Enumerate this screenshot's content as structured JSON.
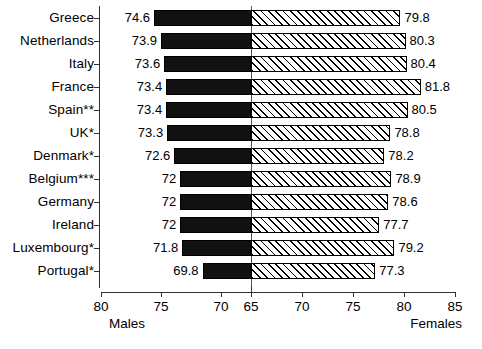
{
  "chart_data": {
    "type": "bar",
    "subtype": "bidirectional-population-pyramid",
    "title": "",
    "subtitle": "",
    "xlabel": "",
    "ylabel": "",
    "grid": false,
    "legend_position": "axis-ends",
    "categories": [
      "Greece",
      "Netherlands",
      "Italy",
      "France",
      "Spain**",
      "UK*",
      "Denmark*",
      "Belgium***",
      "Germany",
      "Ireland",
      "Luxembourg*",
      "Portugal*"
    ],
    "series": [
      {
        "name": "Males",
        "side": "left",
        "fill": "solid-black",
        "values": [
          74.6,
          73.9,
          73.6,
          73.4,
          73.4,
          73.3,
          72.6,
          72,
          72,
          72,
          71.8,
          69.8
        ],
        "value_labels": [
          "74.6",
          "73.9",
          "73.6",
          "73.4",
          "73.4",
          "73.3",
          "72.6",
          "72",
          "72",
          "72",
          "71.8",
          "69.8"
        ]
      },
      {
        "name": "Females",
        "side": "right",
        "fill": "diagonal-hatch",
        "values": [
          79.8,
          80.3,
          80.4,
          81.8,
          80.5,
          78.8,
          78.2,
          78.9,
          78.6,
          77.7,
          79.2,
          77.3
        ],
        "value_labels": [
          "79.8",
          "80.3",
          "80.4",
          "81.8",
          "80.5",
          "78.8",
          "78.2",
          "78.9",
          "78.6",
          "77.7",
          "79.2",
          "77.3"
        ]
      }
    ],
    "axis": {
      "center_value": 65,
      "left_end_value": 80,
      "right_end_value": 85,
      "tick_labels": [
        "80",
        "75",
        "70",
        "65",
        "70",
        "75",
        "80",
        "85"
      ],
      "tick_values": [
        80,
        75,
        70,
        65,
        70,
        75,
        80,
        85
      ],
      "left_axis_name": "Males",
      "right_axis_name": "Females"
    },
    "colors": {
      "male_bar": "#111111",
      "female_bar_line": "#000000",
      "female_bar_background": "#ffffff",
      "axis": "#333333",
      "text": "#000000",
      "background": "#ffffff"
    }
  }
}
